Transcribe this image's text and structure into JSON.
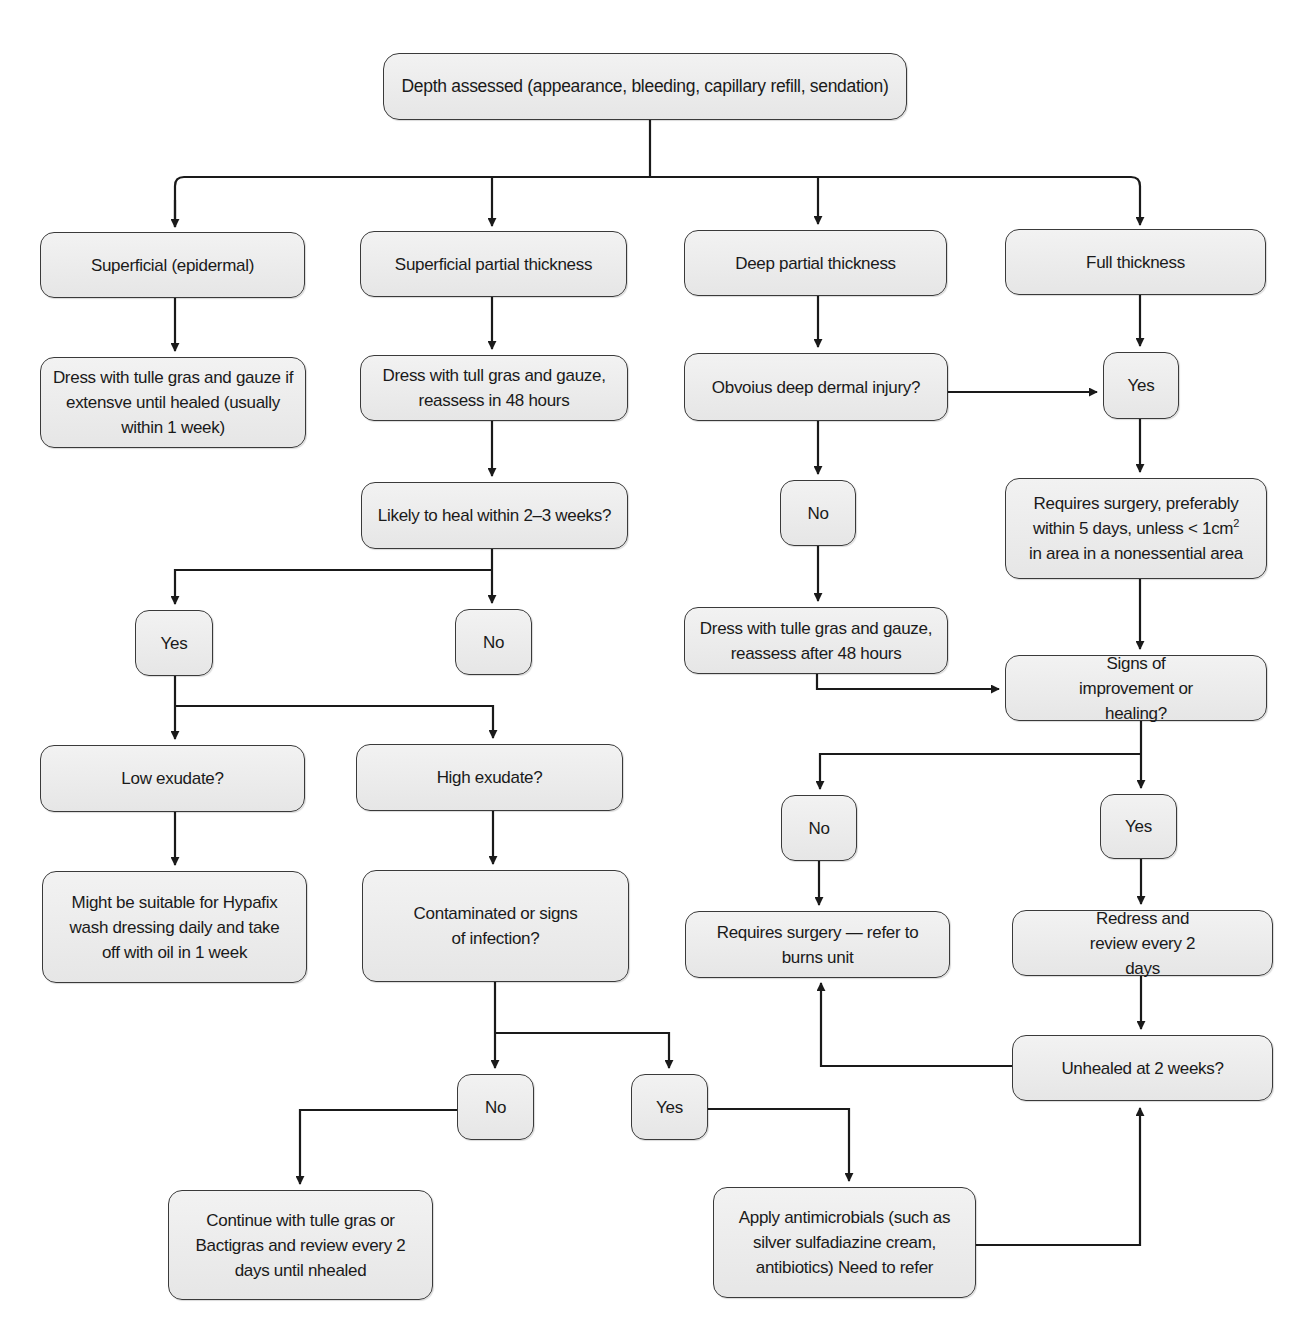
{
  "diagram": {
    "type": "flowchart",
    "nodes": {
      "root": "Depth assessed (appearance, bleeding, capillary refill, sendation)",
      "superficial": "Superficial (epidermal)",
      "superficial_partial": "Superficial partial thickness",
      "deep_partial": "Deep partial thickness",
      "full_thickness": "Full thickness",
      "superficial_dress": "Dress with tulle gras and gauze if extensve until healed (usually within 1 week)",
      "spt_dress": "Dress with tull gras and gauze, reassess in 48 hours",
      "likely_heal": "Likely to heal within 2–3 weeks?",
      "likely_yes": "Yes",
      "likely_no": "No",
      "low_exudate": "Low exudate?",
      "high_exudate": "High exudate?",
      "hypafix": "Might be suitable for Hypafix wash dressing daily and take off with oil in 1 week",
      "contaminated": "Contaminated or signs of infection?",
      "contaminated_no": "No",
      "contaminated_yes": "Yes",
      "continue_tulle": "Continue with tulle gras or Bactigras and review every 2 days until nhealed",
      "apply_antimicrobials": "Apply antimicrobials (such as silver sulfadiazine cream, antibiotics) Need to refer",
      "obvious_deep": "Obvoius deep dermal injury?",
      "obvious_yes": "Yes",
      "obvious_no": "No",
      "requires_surgery_line1": "Requires surgery, preferably",
      "requires_surgery_line2_pre": "within 5 days, unless < 1cm",
      "requires_surgery_sup": "2",
      "requires_surgery_line3": "in area in a nonessential area",
      "dp_dress": "Dress with tulle gras and gauze, reassess after 48 hours",
      "signs_improvement": "Signs of improvement or healing?",
      "signs_no": "No",
      "signs_yes": "Yes",
      "refer_burns": "Requires surgery — refer to burns unit",
      "redress": "Redress and review every 2 days",
      "unhealed": "Unhealed at 2 weeks?"
    },
    "edges": [
      [
        "root",
        "superficial"
      ],
      [
        "root",
        "superficial_partial"
      ],
      [
        "root",
        "deep_partial"
      ],
      [
        "root",
        "full_thickness"
      ],
      [
        "superficial",
        "superficial_dress"
      ],
      [
        "superficial_partial",
        "spt_dress"
      ],
      [
        "spt_dress",
        "likely_heal"
      ],
      [
        "likely_heal",
        "likely_yes"
      ],
      [
        "likely_heal",
        "likely_no"
      ],
      [
        "likely_yes",
        "low_exudate"
      ],
      [
        "likely_yes",
        "high_exudate"
      ],
      [
        "low_exudate",
        "hypafix"
      ],
      [
        "high_exudate",
        "contaminated"
      ],
      [
        "contaminated",
        "contaminated_no"
      ],
      [
        "contaminated",
        "contaminated_yes"
      ],
      [
        "contaminated_no",
        "continue_tulle"
      ],
      [
        "contaminated_yes",
        "apply_antimicrobials"
      ],
      [
        "apply_antimicrobials",
        "unhealed"
      ],
      [
        "deep_partial",
        "obvious_deep"
      ],
      [
        "obvious_deep",
        "obvious_yes"
      ],
      [
        "obvious_deep",
        "obvious_no"
      ],
      [
        "full_thickness",
        "obvious_yes"
      ],
      [
        "obvious_yes",
        "requires_surgery"
      ],
      [
        "obvious_no",
        "dp_dress"
      ],
      [
        "dp_dress",
        "signs_improvement"
      ],
      [
        "requires_surgery",
        "signs_improvement"
      ],
      [
        "signs_improvement",
        "signs_no"
      ],
      [
        "signs_improvement",
        "signs_yes"
      ],
      [
        "signs_no",
        "refer_burns"
      ],
      [
        "signs_yes",
        "redress"
      ],
      [
        "redress",
        "unhealed"
      ],
      [
        "unhealed",
        "refer_burns"
      ]
    ],
    "colors": {
      "box_fill": "#ebebeb",
      "box_border": "#3a3a3a",
      "line": "#1a1a1a",
      "text": "#1a1a1a"
    }
  }
}
